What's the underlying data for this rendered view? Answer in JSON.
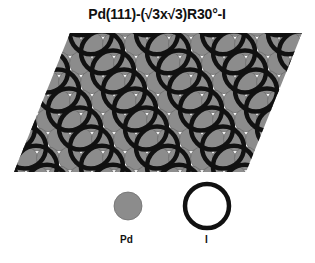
{
  "title": "Pd(111)-(√3x√3)R30°-I",
  "colors": {
    "pd_fill": "#8c8c8c",
    "pd_stroke": "#6e6e6e",
    "i_ring": "#111111",
    "background": "#ffffff"
  },
  "lattice": {
    "pd_spacing": 22,
    "pd_radius": 11.5,
    "i_radius": 21,
    "i_stroke_width": 4.5,
    "parallelogram": [
      [
        70,
        33
      ],
      [
        302,
        33
      ],
      [
        246,
        172
      ],
      [
        14,
        172
      ]
    ]
  },
  "legend": {
    "pd": {
      "label": "Pd",
      "cx": 128,
      "cy": 206,
      "r": 14
    },
    "i": {
      "label": "I",
      "cx": 207,
      "cy": 206,
      "r": 22
    }
  }
}
